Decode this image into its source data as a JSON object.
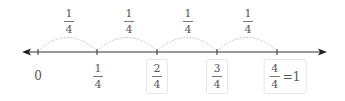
{
  "number_line": {
    "ticks_x": [
      38,
      97,
      157,
      217,
      277
    ],
    "line_y": 52,
    "colors": {
      "line": "#333333",
      "arc": "#bbbbbb",
      "text": "#555555",
      "box_border": "#e6e6e6"
    }
  },
  "jumps": [
    {
      "num": "1",
      "den": "4"
    },
    {
      "num": "1",
      "den": "4"
    },
    {
      "num": "1",
      "den": "4"
    },
    {
      "num": "1",
      "den": "4"
    }
  ],
  "labels": {
    "zero": "0",
    "first": {
      "num": "1",
      "den": "4"
    },
    "second": {
      "num": "2",
      "den": "4"
    },
    "third": {
      "num": "3",
      "den": "4"
    },
    "fourth": {
      "num": "4",
      "den": "4",
      "equals": "=1"
    }
  }
}
